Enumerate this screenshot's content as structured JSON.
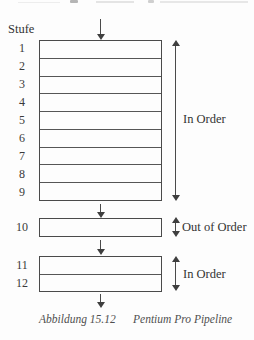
{
  "figure": {
    "stage_column_label": "Stufe",
    "stages_in_order_top": [
      "1",
      "2",
      "3",
      "4",
      "5",
      "6",
      "7",
      "8",
      "9"
    ],
    "stage_out_of_order": "10",
    "stages_in_order_bottom": [
      "11",
      "12"
    ],
    "annotations": {
      "in_order_top": "In Order",
      "out_of_order": "Out of Order",
      "in_order_bottom": "In Order"
    },
    "caption": {
      "figure_number": "Abbildung 15.12",
      "figure_title": "Pentium Pro Pipeline"
    },
    "colors": {
      "line": "#4a4a4a",
      "text": "#333333",
      "caption_text": "#4f4f4f",
      "background": "#fdfdfd"
    }
  }
}
